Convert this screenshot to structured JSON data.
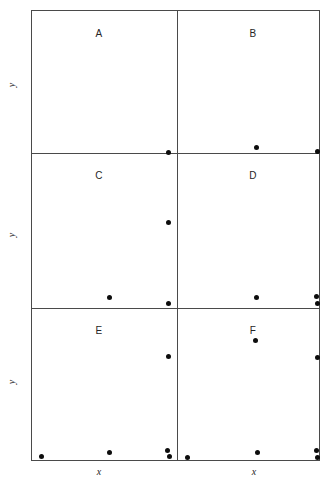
{
  "figure": {
    "type": "scatter-panel-grid",
    "panel_rows": 3,
    "panel_cols": 2,
    "frame": {
      "left": 31,
      "top": 10,
      "width": 289,
      "height": 451
    },
    "dot_color": "#0d0d0d",
    "frame_color": "#4a4a4a",
    "background": "#ffffff"
  },
  "axis_labels": {
    "y": [
      {
        "text": "y",
        "x": 11,
        "y": 85
      },
      {
        "text": "y",
        "x": 11,
        "y": 235
      },
      {
        "text": "y",
        "x": 11,
        "y": 382
      }
    ],
    "x": [
      {
        "text": "x",
        "x": 99,
        "y": 471
      },
      {
        "text": "x",
        "x": 254,
        "y": 471
      }
    ]
  },
  "dividers": {
    "vertical": [
      {
        "x": 145
      }
    ],
    "horizontal": [
      {
        "y": 142
      },
      {
        "y": 297
      }
    ]
  },
  "panels": [
    {
      "id": "A",
      "label": "A",
      "label_x": 99,
      "label_y": 33
    },
    {
      "id": "B",
      "label": "B",
      "label_x": 253,
      "label_y": 33
    },
    {
      "id": "C",
      "label": "C",
      "label_x": 99,
      "label_y": 175
    },
    {
      "id": "D",
      "label": "D",
      "label_x": 253,
      "label_y": 175
    },
    {
      "id": "E",
      "label": "E",
      "label_x": 99,
      "label_y": 330
    },
    {
      "id": "F",
      "label": "F",
      "label_x": 253,
      "label_y": 330
    }
  ],
  "chart_data": {
    "type": "scatter",
    "title": "",
    "xlabel": "x",
    "ylabel": "y",
    "grid": false,
    "legend": null,
    "note": "Six panels (A-F) arranged 2 columns x 3 rows; each panel shares unlabeled x and y axes. Points are plotted in pixel coordinates of the source image.",
    "panels": [
      {
        "name": "A",
        "xlabel": "x",
        "ylabel": "y",
        "points": [
          {
            "x": 168,
            "y": 152
          }
        ]
      },
      {
        "name": "B",
        "xlabel": "x",
        "ylabel": "y",
        "points": [
          {
            "x": 256,
            "y": 147
          },
          {
            "x": 317,
            "y": 151
          }
        ]
      },
      {
        "name": "C",
        "xlabel": "x",
        "ylabel": "y",
        "points": [
          {
            "x": 168,
            "y": 222
          },
          {
            "x": 109,
            "y": 297
          },
          {
            "x": 168,
            "y": 303
          }
        ]
      },
      {
        "name": "D",
        "xlabel": "x",
        "ylabel": "y",
        "points": [
          {
            "x": 256,
            "y": 297
          },
          {
            "x": 316,
            "y": 296
          },
          {
            "x": 317,
            "y": 303
          }
        ]
      },
      {
        "name": "E",
        "xlabel": "x",
        "ylabel": "y",
        "points": [
          {
            "x": 168,
            "y": 356
          },
          {
            "x": 41,
            "y": 456
          },
          {
            "x": 109,
            "y": 452
          },
          {
            "x": 167,
            "y": 450
          },
          {
            "x": 169,
            "y": 456
          }
        ]
      },
      {
        "name": "F",
        "xlabel": "x",
        "ylabel": "y",
        "points": [
          {
            "x": 255,
            "y": 340
          },
          {
            "x": 317,
            "y": 357
          },
          {
            "x": 187,
            "y": 457
          },
          {
            "x": 257,
            "y": 452
          },
          {
            "x": 316,
            "y": 450
          },
          {
            "x": 317,
            "y": 457
          }
        ]
      }
    ]
  }
}
